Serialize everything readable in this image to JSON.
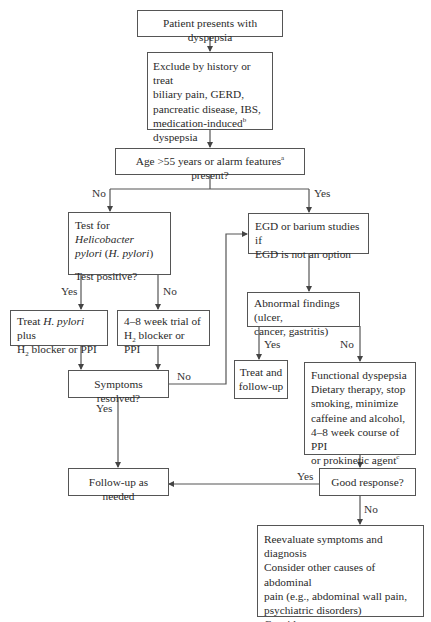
{
  "diagram": {
    "type": "flowchart",
    "nodes": {
      "start": {
        "text": "Patient presents with dyspepsia"
      },
      "exclude": {
        "line1": "Exclude by history or treat",
        "line2": "biliary pain, GERD,",
        "line3": "pancreatic disease, IBS,",
        "line4": "medication-induced",
        "line4_sup": "b",
        "line5": "dyspepsia"
      },
      "age_check": {
        "pre": "Age >55 years or alarm features",
        "sup": "a",
        "post": " present?"
      },
      "hpylori_test": {
        "line1_pre": "Test for ",
        "line1_italic": "Helicobacter",
        "line2_italic": "pylori",
        "line2_open": " (",
        "line2_italic2": "H. pylori",
        "line2_close": ")",
        "line3": "Test positive?"
      },
      "egd": {
        "line1": "EGD or barium studies if",
        "line2": "EGD is not an option"
      },
      "treat_hpylori": {
        "line1_pre": "Treat ",
        "line1_italic": "H. pylori",
        "line1_post": " plus",
        "line2_pre": "H",
        "line2_sub": "2",
        "line2_post": " blocker or PPI"
      },
      "trial": {
        "line1": "4–8 week trial of",
        "line2_pre": "H",
        "line2_sub": "2",
        "line2_post": " blocker or PPI"
      },
      "abnormal": {
        "line1": "Abnormal findings (ulcer,",
        "line2": "cancer, gastritis)"
      },
      "symptoms_resolved": {
        "text": "Symptoms resolved?"
      },
      "treat_followup": {
        "line1": "Treat and",
        "line2": "follow-up"
      },
      "functional": {
        "line1": "Functional dyspepsia",
        "line2": "Dietary therapy, stop",
        "line3": "smoking, minimize",
        "line4": "caffeine and alcohol,",
        "line5": "4–8 week course of PPI",
        "line6": "or prokinetic agent",
        "line6_sup": "c"
      },
      "followup_needed": {
        "text": "Follow-up as needed"
      },
      "good_response": {
        "text": "Good  response?"
      },
      "reevaluate": {
        "line1": "Reevaluate symptoms and diagnosis",
        "line2": "Consider other causes of abdominal",
        "line3": "pain (e.g., abdominal wall pain,",
        "line4": "psychiatric disorders)",
        "line5": "Consider behavioral/psychotherapy,",
        "line6": "antidepressants"
      }
    },
    "edge_labels": {
      "age_no": "No",
      "age_yes": "Yes",
      "test_yes": "Yes",
      "test_no": "No",
      "symptoms_no": "No",
      "symptoms_yes": "Yes",
      "abnormal_yes": "Yes",
      "abnormal_no": "No",
      "response_yes": "Yes",
      "response_no": "No"
    },
    "colors": {
      "line": "#555555",
      "text": "#2a2a2a",
      "background": "#ffffff"
    }
  }
}
